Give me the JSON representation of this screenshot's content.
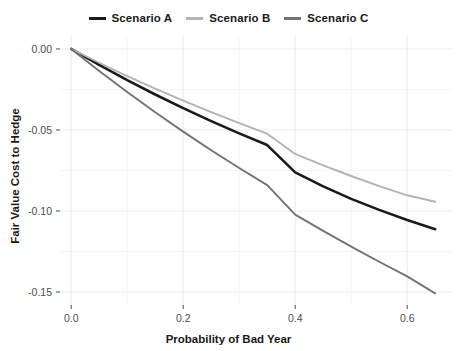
{
  "chart_data": {
    "type": "line",
    "title": "",
    "xlabel": "Probability of Bad Year",
    "ylabel": "Fair Value Cost to Hedge",
    "xlim": [
      -0.02,
      0.68
    ],
    "ylim": [
      -0.158,
      0.008
    ],
    "xticks": [
      0.0,
      0.2,
      0.4,
      0.6
    ],
    "xticklabels": [
      "0.0",
      "0.2",
      "0.4",
      "0.6"
    ],
    "yticks": [
      0.0,
      -0.05,
      -0.1,
      -0.15
    ],
    "yticklabels": [
      "0.00",
      "-0.05",
      "-0.10",
      "-0.15"
    ],
    "grid": true,
    "legend_position": "top",
    "x": [
      0.0,
      0.05,
      0.1,
      0.15,
      0.2,
      0.25,
      0.3,
      0.35,
      0.4,
      0.45,
      0.5,
      0.55,
      0.6,
      0.65
    ],
    "series": [
      {
        "name": "Scenario A",
        "color": "#1a1a1a",
        "values": [
          0.0,
          -0.0098,
          -0.0192,
          -0.0281,
          -0.0365,
          -0.0445,
          -0.0521,
          -0.0593,
          -0.0762,
          -0.0848,
          -0.0925,
          -0.0993,
          -0.1056,
          -0.1112
        ]
      },
      {
        "name": "Scenario B",
        "color": "#b3b3b3",
        "values": [
          0.0,
          -0.0085,
          -0.0167,
          -0.0245,
          -0.0319,
          -0.039,
          -0.0458,
          -0.0523,
          -0.0648,
          -0.0718,
          -0.0784,
          -0.0846,
          -0.0903,
          -0.0943
        ]
      },
      {
        "name": "Scenario C",
        "color": "#737373",
        "values": [
          0.0,
          -0.0136,
          -0.0266,
          -0.0391,
          -0.051,
          -0.0625,
          -0.0735,
          -0.084,
          -0.1022,
          -0.1123,
          -0.122,
          -0.1313,
          -0.1403,
          -0.1508
        ]
      }
    ]
  },
  "legend": {
    "items": [
      {
        "label": "Scenario A",
        "color": "#1a1a1a"
      },
      {
        "label": "Scenario B",
        "color": "#b3b3b3"
      },
      {
        "label": "Scenario C",
        "color": "#737373"
      }
    ]
  },
  "axes": {
    "x_title": "Probability of Bad Year",
    "y_title": "Fair Value Cost to Hedge",
    "x_tick_labels": [
      "0.0",
      "0.2",
      "0.4",
      "0.6"
    ],
    "y_tick_labels": [
      "0.00",
      "-0.05",
      "-0.10",
      "-0.15"
    ]
  },
  "style": {
    "background": "#ffffff",
    "gridline_major": "#ebebeb",
    "gridline_minor": "#f5f5f5",
    "tick_text": "#4d4d4d",
    "title_text": "#1a1a1a"
  }
}
